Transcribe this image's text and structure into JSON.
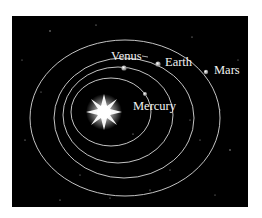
{
  "diagram": {
    "sun": {
      "name": "sun-icon"
    },
    "planets": [
      {
        "name": "Mercury",
        "label": "Mercury"
      },
      {
        "name": "Venus",
        "label": "Venus"
      },
      {
        "name": "Earth",
        "label": "Earth"
      },
      {
        "name": "Mars",
        "label": "Mars"
      }
    ],
    "colors": {
      "background": "#000000",
      "orbit": "#d9d9d9",
      "text": "#f2f2f2",
      "page": "#ffffff"
    }
  }
}
